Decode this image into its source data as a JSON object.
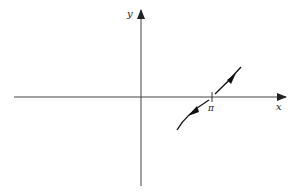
{
  "diagram": {
    "type": "graph-sketch",
    "axes": {
      "x_label": "x",
      "y_label": "y"
    },
    "ticks": [
      {
        "label": "π",
        "position": "x = pi"
      }
    ],
    "curve": {
      "description": "Increasing curve segment passing through (π, 0), with arrows pointing away from π in both directions",
      "lower_branch_arrow": "down-left",
      "upper_branch_arrow": "up-right"
    },
    "colors": {
      "axis": "#333333",
      "curve": "#111111",
      "background": "#ffffff"
    }
  }
}
